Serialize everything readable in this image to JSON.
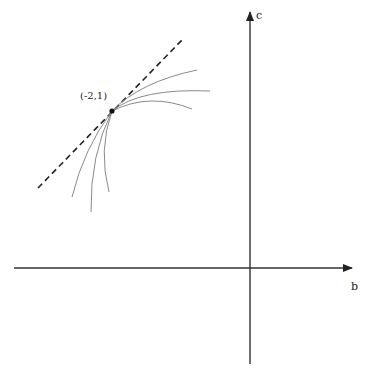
{
  "diagram": {
    "type": "phase-plane",
    "axes": {
      "horizontal": {
        "label": "b",
        "from": [
          14,
          268
        ],
        "to": [
          352,
          268
        ]
      },
      "vertical": {
        "label": "c",
        "from": [
          250,
          364
        ],
        "to": [
          250,
          10
        ]
      },
      "origin": [
        250,
        268
      ]
    },
    "point": {
      "label": "(-2,1)",
      "position": [
        112,
        111
      ]
    },
    "tangent_line": {
      "style": "dashed",
      "from": [
        38,
        188
      ],
      "to": [
        182,
        40
      ]
    },
    "curves": [
      {
        "id": "upper-1",
        "end": [
          197,
          70
        ]
      },
      {
        "id": "upper-2",
        "end": [
          210,
          91
        ]
      },
      {
        "id": "upper-3",
        "end": [
          192,
          109
        ]
      },
      {
        "id": "lower-1",
        "end": [
          72,
          197
        ]
      },
      {
        "id": "lower-2",
        "end": [
          91,
          212
        ]
      },
      {
        "id": "lower-3",
        "end": [
          109,
          192
        ]
      }
    ],
    "colors": {
      "axis": "#222222",
      "curve": "#8a8a8a",
      "dashed": "#222222",
      "point": "#111111"
    }
  }
}
